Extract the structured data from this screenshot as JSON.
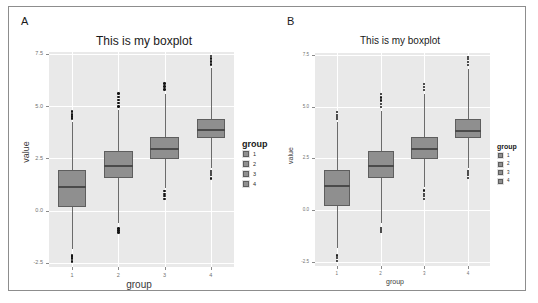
{
  "figure": {
    "panels": [
      {
        "letter": "A",
        "title": "This is my boxplot",
        "xlabel": "group",
        "ylabel": "value",
        "legend_title": "group"
      },
      {
        "letter": "B",
        "title": "This is my boxplot",
        "xlabel": "group",
        "ylabel": "value",
        "legend_title": "group"
      }
    ]
  },
  "chart_data": {
    "type": "box",
    "title": "This is my boxplot",
    "xlabel": "group",
    "ylabel": "value",
    "categories": [
      "1",
      "2",
      "3",
      "4"
    ],
    "ytick_labels": [
      "-2.5",
      "0.0",
      "2.5",
      "5.0",
      "7.5"
    ],
    "ytick_values": [
      -2.5,
      0.0,
      2.5,
      5.0,
      7.5
    ],
    "ylim": [
      -2.7,
      7.6
    ],
    "grid": true,
    "legend": {
      "title": "group",
      "position": "right",
      "entries": [
        "1",
        "2",
        "3",
        "4"
      ]
    },
    "colors": {
      "panel_background": "#e9e9e9",
      "gridline": "#ffffff",
      "box_fill": "#8f8f8f",
      "box_border": "#5e5e5e",
      "median": "#4a4a4a",
      "outlier": "#141414",
      "figure_border": "#8d8d8d"
    },
    "boxes": [
      {
        "group": "1",
        "min_whisker": -1.85,
        "q1": 0.18,
        "median": 1.2,
        "q3": 1.95,
        "max_whisker": 4.25,
        "outliers": [
          -2.45,
          -2.3,
          -2.2,
          -2.15,
          4.4,
          4.5,
          4.6,
          4.75
        ]
      },
      {
        "group": "2",
        "min_whisker": -0.6,
        "q1": 1.55,
        "median": 2.2,
        "q3": 2.85,
        "max_whisker": 4.8,
        "outliers": [
          -1.05,
          -0.95,
          -0.85,
          5.0,
          5.15,
          5.3,
          5.45,
          5.6
        ]
      },
      {
        "group": "3",
        "min_whisker": 1.1,
        "q1": 2.45,
        "median": 3.0,
        "q3": 3.55,
        "max_whisker": 5.6,
        "outliers": [
          0.55,
          0.7,
          0.8,
          0.95,
          5.8,
          5.95,
          6.1
        ]
      },
      {
        "group": "4",
        "min_whisker": 2.05,
        "q1": 3.5,
        "median": 3.9,
        "q3": 4.4,
        "max_whisker": 6.85,
        "outliers": [
          1.55,
          1.7,
          1.8,
          1.9,
          7.0,
          7.15,
          7.3,
          7.4
        ]
      }
    ]
  }
}
